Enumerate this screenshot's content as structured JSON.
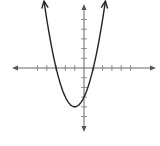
{
  "chart_data": {
    "type": "line",
    "title": "",
    "xlabel": "",
    "ylabel": "",
    "function": "y = x^2 + 2x - 3",
    "vertex": [
      -1,
      -4
    ],
    "roots": [
      -3,
      1
    ],
    "y_intercept": -3,
    "xlim": [
      -7,
      7.5
    ],
    "ylim": [
      -6.5,
      6.5
    ],
    "x_ticks": [
      -5,
      -4,
      -3,
      -2,
      -1,
      1,
      2,
      3,
      4,
      5
    ],
    "y_ticks": [
      -5,
      -4,
      -3,
      -2,
      -1,
      1,
      2,
      3,
      4,
      5
    ],
    "curve_x_range": [
      -4.3,
      2.3
    ],
    "arrows_on_curve": true,
    "arrows_on_axes": true,
    "grid": false,
    "legend": null
  },
  "style": {
    "axis_color": "#555555",
    "curve_color": "#222222",
    "tick_color": "#777777",
    "background": "#ffffff"
  }
}
